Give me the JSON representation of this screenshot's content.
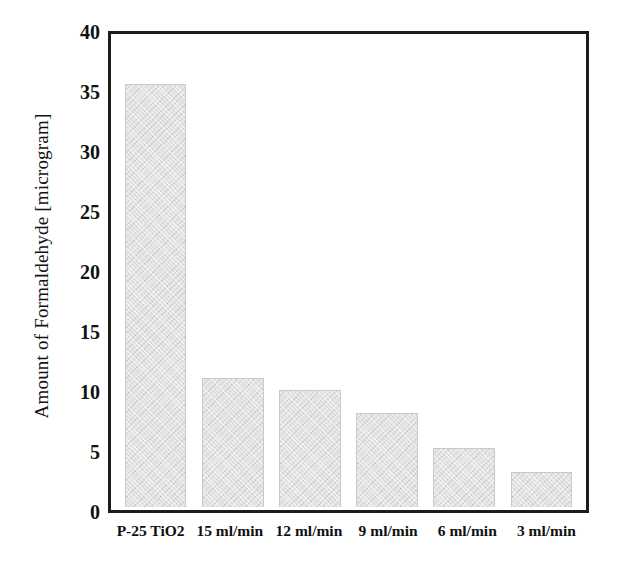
{
  "chart_data": {
    "type": "bar",
    "title": "",
    "xlabel": "",
    "ylabel": "Amount of Formaldehyde [microgram]",
    "categories": [
      "P-25 TiO2",
      "15 ml/min",
      "12 ml/min",
      "9 ml/min",
      "6 ml/min",
      "3 ml/min"
    ],
    "values": [
      36,
      11,
      10,
      8,
      5,
      3
    ],
    "ylim": [
      0,
      40
    ],
    "yticks": [
      0,
      5,
      10,
      15,
      20,
      25,
      30,
      35,
      40
    ],
    "ytick_labels": [
      "0",
      "5",
      "10",
      "15",
      "20",
      "25",
      "30",
      "35",
      "40"
    ],
    "grid": false,
    "legend": null,
    "bar_fill_color": "#e3e3e3",
    "bar_edge_color": "#c9c9c9",
    "axis_color": "#1c1c1c",
    "background_color": "#ffffff"
  }
}
